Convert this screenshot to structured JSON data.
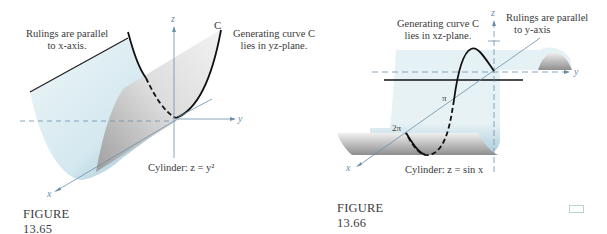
{
  "figure_1": {
    "caption": "FIGURE  13.65",
    "annotation_rulings_line1": "Rulings are parallel",
    "annotation_rulings_line2": "to x-axis.",
    "annotation_curve_line1": "Generating curve C",
    "annotation_curve_line2": "lies in yz-plane.",
    "curve_label": "C",
    "equation": "Cylinder: z = y²",
    "axes": {
      "x": "x",
      "y": "y",
      "z": "z"
    }
  },
  "figure_2": {
    "caption": "FIGURE  13.66",
    "annotation_curve_line1": "Generating curve C",
    "annotation_curve_line2": "lies in xz-plane.",
    "annotation_rulings_line1": "Rulings are parallel",
    "annotation_rulings_line2": "to y-axis",
    "equation": "Cylinder: z = sin x",
    "tick_pi": "π",
    "tick_2pi": "2π",
    "axes": {
      "x": "x",
      "y": "y",
      "z": "z"
    }
  },
  "colors": {
    "surface_blue": "#cfe4ec",
    "surface_gray": "#d8d8d8",
    "axis": "#6a8fa8",
    "curve": "#111111"
  }
}
